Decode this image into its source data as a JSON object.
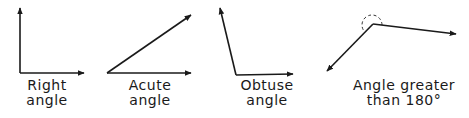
{
  "diagram": {
    "stroke_color": "#1a1a1a",
    "angles": [
      {
        "id": "right",
        "label_line1": "Right",
        "label_line2": "angle"
      },
      {
        "id": "acute",
        "label_line1": "Acute",
        "label_line2": "angle"
      },
      {
        "id": "obtuse",
        "label_line1": "Obtuse",
        "label_line2": "angle"
      },
      {
        "id": "reflex",
        "label_line1": "Angle greater",
        "label_line2": "than 180°"
      }
    ]
  }
}
